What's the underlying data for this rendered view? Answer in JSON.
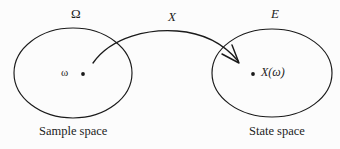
{
  "figure": {
    "type": "diagram",
    "background_color": "#fcfcfc",
    "stroke_color": "#1a1a1a",
    "domain_set": {
      "name": "Ω",
      "caption": "Sample space",
      "point_label": "ω",
      "shape": "ellipse",
      "cx": 73,
      "cy": 73,
      "rx": 59,
      "ry": 45,
      "point_x": 83,
      "point_y": 74
    },
    "codomain_set": {
      "name": "E",
      "caption": "State space",
      "point_label": "X(ω)",
      "shape": "ellipse",
      "cx": 272,
      "cy": 73,
      "rx": 60,
      "ry": 44,
      "point_x": 253,
      "point_y": 74
    },
    "mapping": {
      "name": "X",
      "arrow_start_x": 93,
      "arrow_start_y": 63,
      "arrow_end_x": 238,
      "arrow_end_y": 61,
      "arrow_head_style": "open-v",
      "curve_peak_x": 175,
      "curve_peak_y": 31
    }
  }
}
